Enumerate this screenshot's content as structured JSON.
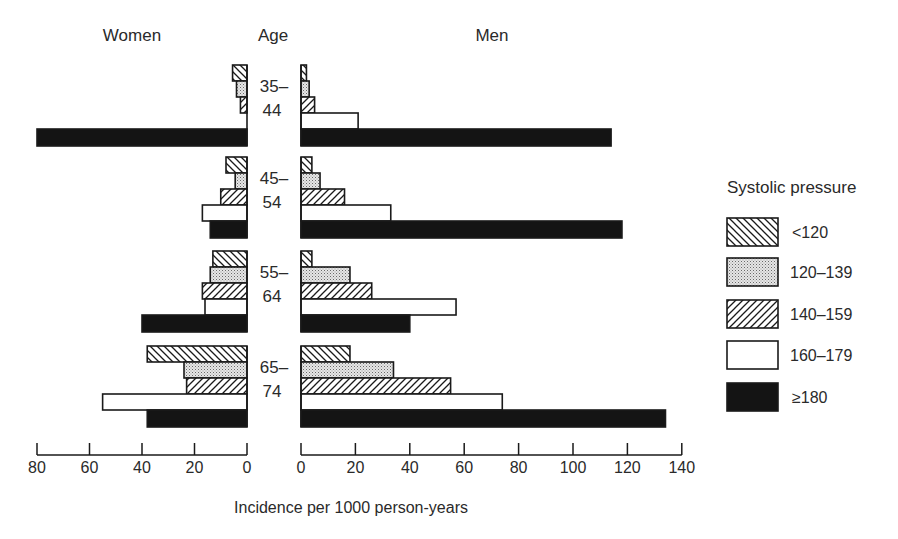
{
  "headers": {
    "women": "Women",
    "age": "Age",
    "men": "Men"
  },
  "legend": {
    "title": "Systolic pressure",
    "items": [
      {
        "key": "lt120",
        "label": "<120",
        "pattern": "hatch-back"
      },
      {
        "key": "120_139",
        "label": "120–139",
        "pattern": "dots"
      },
      {
        "key": "140_159",
        "label": "140–159",
        "pattern": "hatch-fwd"
      },
      {
        "key": "160_179",
        "label": "160–179",
        "pattern": "white"
      },
      {
        "key": "ge180",
        "label": "≥180",
        "pattern": "black"
      }
    ]
  },
  "axes": {
    "women_ticks": [
      "80",
      "60",
      "40",
      "20",
      "0"
    ],
    "men_ticks": [
      "0",
      "20",
      "40",
      "60",
      "80",
      "100",
      "120",
      "140"
    ],
    "xlabel": "Incidence per 1000 person-years"
  },
  "colors": {
    "ink": "#1a1a1a",
    "black_fill": "#141414",
    "dot_fill": "#d8d8d8"
  },
  "chart_data": {
    "type": "bar",
    "orientation": "horizontal",
    "layout": "back-to-back (population pyramid style)",
    "title": "",
    "xlabel": "Incidence per 1000 person-years",
    "ylabel": "Age",
    "panels": [
      "Women",
      "Men"
    ],
    "xlim": {
      "Women": [
        80,
        0
      ],
      "Men": [
        0,
        140
      ]
    },
    "categories": [
      "35–44",
      "45–54",
      "55–64",
      "65–74"
    ],
    "legend_title": "Systolic pressure",
    "legend_position": "right",
    "grid": false,
    "series": [
      {
        "name": "<120",
        "women": [
          5.5,
          8,
          13,
          38
        ],
        "men": [
          2,
          4,
          4,
          18
        ]
      },
      {
        "name": "120–139",
        "women": [
          4,
          4.5,
          14,
          24
        ],
        "men": [
          3,
          7,
          18,
          34
        ]
      },
      {
        "name": "140–159",
        "women": [
          2.5,
          10,
          17,
          23
        ],
        "men": [
          5,
          16,
          26,
          55
        ]
      },
      {
        "name": "160–179",
        "women": [
          0,
          17,
          16,
          55
        ],
        "men": [
          21,
          33,
          57,
          74
        ]
      },
      {
        "name": "≥180",
        "women": [
          80,
          14,
          40,
          38
        ],
        "men": [
          114,
          118,
          40,
          134
        ]
      }
    ]
  }
}
